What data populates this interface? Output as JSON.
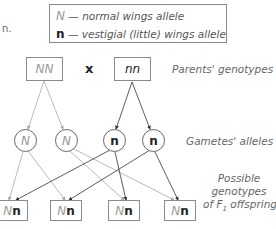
{
  "fragment_text": "n.",
  "legend": {
    "items": [
      {
        "symbol": "N",
        "description": "— normal wings allele"
      },
      {
        "symbol": "n",
        "description": "— vestigial (little) wings allele"
      }
    ]
  },
  "parents": {
    "left": "NN",
    "cross_symbol": "x",
    "right": "nn",
    "label": "Parents' genotypes"
  },
  "gametes": {
    "alleles": [
      "N",
      "N",
      "n",
      "n"
    ],
    "label": "Gametes' alleles"
  },
  "offspring": {
    "genotypes": [
      {
        "N": "N",
        "n": "n"
      },
      {
        "N": "N",
        "n": "n"
      },
      {
        "N": "N",
        "n": "n"
      },
      {
        "N": "N",
        "n": "n"
      }
    ],
    "label_lines": [
      "Possible",
      "genotypes",
      "of F",
      "1",
      " offspring"
    ]
  },
  "colors": {
    "dominant_line": "#a8a8a8",
    "recessive_line": "#333333",
    "box_border": "#8a8a8a"
  }
}
